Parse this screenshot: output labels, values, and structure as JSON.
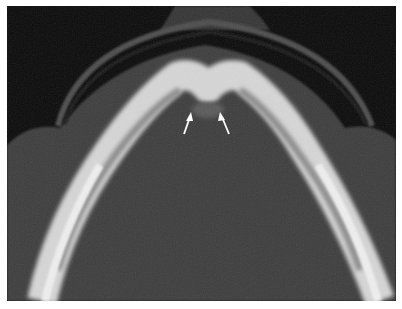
{
  "image": {
    "description": "Axial CT scan of mandible with two white arrows pointing at the symphysis",
    "modality": "CT",
    "colors": {
      "background": "#0a0a0a",
      "soft_tissue": "#3c3c3c",
      "arc": "#4a4a4a",
      "bone": "#d8d8d8",
      "arrow": "#ffffff"
    },
    "annotations": [
      {
        "type": "arrow",
        "label": "arrow-left",
        "x": 183,
        "y": 135
      },
      {
        "type": "arrow",
        "label": "arrow-right",
        "x": 228,
        "y": 135
      }
    ]
  }
}
